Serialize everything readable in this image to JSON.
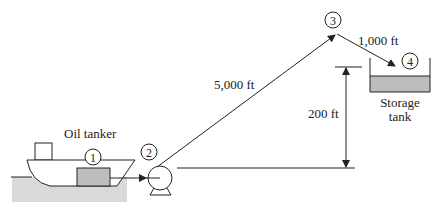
{
  "diagram": {
    "type": "pipeline-schematic",
    "colors": {
      "line": "#222222",
      "fill_gray": "#bdbdbd",
      "water": "#d9d9d9",
      "background": "#ffffff"
    },
    "labels": {
      "tanker": "Oil tanker",
      "storage_line1": "Storage",
      "storage_line2": "tank",
      "pipe_length_1": "5,000 ft",
      "pipe_length_2": "1,000 ft",
      "elevation": "200 ft"
    },
    "points": [
      {
        "id": "1",
        "label": "1",
        "location": "oil tanker"
      },
      {
        "id": "2",
        "label": "2",
        "location": "pump inlet"
      },
      {
        "id": "3",
        "label": "3",
        "location": "pipeline peak"
      },
      {
        "id": "4",
        "label": "4",
        "location": "storage tank surface"
      }
    ]
  }
}
